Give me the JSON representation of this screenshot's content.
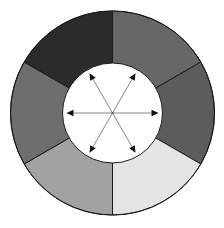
{
  "canvas": {
    "width": 224,
    "height": 228,
    "background": "#ffffff"
  },
  "wheel": {
    "center": {
      "x": 112.5,
      "y": 113
    },
    "outer_radius": 102,
    "inner_radius": 50,
    "outline_color": "#1a1a1a",
    "inner_fill": "#ffffff",
    "segments": [
      {
        "name": "segment-top-right",
        "start_deg": 0,
        "end_deg": 60,
        "fill": "#676767"
      },
      {
        "name": "segment-right",
        "start_deg": 60,
        "end_deg": 120,
        "fill": "#5c5c5c"
      },
      {
        "name": "segment-bottom-right",
        "start_deg": 120,
        "end_deg": 180,
        "fill": "#e4e4e4"
      },
      {
        "name": "segment-bottom-left",
        "start_deg": 180,
        "end_deg": 240,
        "fill": "#a2a2a2"
      },
      {
        "name": "segment-left",
        "start_deg": 240,
        "end_deg": 300,
        "fill": "#6e6e6e"
      },
      {
        "name": "segment-top-left",
        "start_deg": 300,
        "end_deg": 360,
        "fill": "#2b2b2b"
      }
    ]
  },
  "arrows": {
    "color": "#777777",
    "head_color": "#111111",
    "length": 46,
    "directions_deg": [
      0,
      60,
      120,
      180,
      240,
      300
    ]
  }
}
